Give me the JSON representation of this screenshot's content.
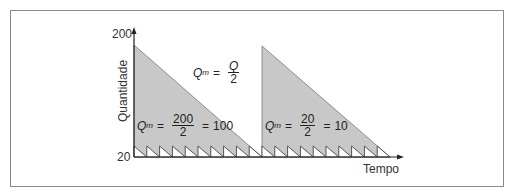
{
  "diagram": {
    "title": "",
    "y_axis_label": "Quantidade",
    "x_axis_label": "Tempo",
    "y_ticks": [
      "200",
      "20"
    ],
    "general_formula": {
      "lhs": "Q",
      "lhs_sub": "m",
      "equals": "=",
      "numerator": "Q",
      "denominator": "2"
    },
    "formula_large": {
      "lhs": "Q",
      "lhs_sub": "m",
      "equals": "=",
      "numerator": "200",
      "denominator": "2",
      "result_eq": "=",
      "result": "100"
    },
    "formula_small": {
      "lhs": "Q",
      "lhs_sub": "m",
      "equals": "=",
      "numerator": "20",
      "denominator": "2",
      "result_eq": "=",
      "result": "10"
    },
    "colors": {
      "fill": "#c8c8c8",
      "stroke": "#444444",
      "frame": "#8a8a8a"
    },
    "large_cycles": 2,
    "small_cycles_per_large": 10
  }
}
